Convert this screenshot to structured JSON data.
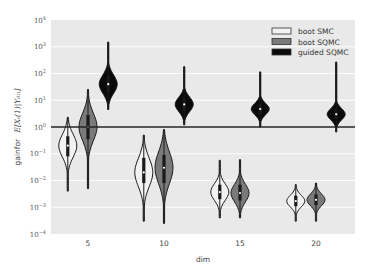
{
  "chart_data": {
    "type": "violin",
    "title": "",
    "xlabel": "dim",
    "ylabel": "gainfor  E[X_t(1)|Y_0:t]",
    "ylabel_prefix": "gainfor",
    "ylabel_math": "E[Xₜ(1)|Y₀:ₜ]",
    "yscale": "log",
    "ylim": [
      0.0001,
      10000
    ],
    "y_ticks": [
      {
        "exp": 4,
        "label": "10",
        "sup": "4"
      },
      {
        "exp": 3,
        "label": "10",
        "sup": "3"
      },
      {
        "exp": 2,
        "label": "10",
        "sup": "2"
      },
      {
        "exp": 1,
        "label": "10",
        "sup": "1"
      },
      {
        "exp": 0,
        "label": "10",
        "sup": "0"
      },
      {
        "exp": -1,
        "label": "10",
        "sup": "−1"
      },
      {
        "exp": -2,
        "label": "10",
        "sup": "−2"
      },
      {
        "exp": -3,
        "label": "10",
        "sup": "−3"
      },
      {
        "exp": -4,
        "label": "10",
        "sup": "−4"
      }
    ],
    "categories": [
      "5",
      "10",
      "15",
      "20"
    ],
    "x_values": [
      5,
      10,
      15,
      20
    ],
    "xlim": [
      2.5,
      22.5
    ],
    "reference_line": 1,
    "grid": true,
    "legend_position": "top-right",
    "series": [
      {
        "name": "boot SMC",
        "fill": "#f2f2f2",
        "offset": -1.33,
        "distributions": [
          {
            "x": 5,
            "min": 0.004,
            "max": 2.3,
            "median": 0.2,
            "q1": 0.08,
            "q3": 0.45
          },
          {
            "x": 10,
            "min": 0.0003,
            "max": 0.5,
            "median": 0.02,
            "q1": 0.008,
            "q3": 0.07
          },
          {
            "x": 15,
            "min": 0.0004,
            "max": 0.057,
            "median": 0.0037,
            "q1": 0.002,
            "q3": 0.007
          },
          {
            "x": 20,
            "min": 0.0003,
            "max": 0.007,
            "median": 0.0017,
            "q1": 0.0011,
            "q3": 0.0027
          }
        ]
      },
      {
        "name": "boot SQMC",
        "fill": "#7a7a7a",
        "offset": 0,
        "distributions": [
          {
            "x": 5,
            "min": 0.005,
            "max": 25,
            "median": 1.0,
            "q1": 0.35,
            "q3": 2.8
          },
          {
            "x": 10,
            "min": 0.00025,
            "max": 0.8,
            "median": 0.03,
            "q1": 0.008,
            "q3": 0.09
          },
          {
            "x": 15,
            "min": 0.0004,
            "max": 0.06,
            "median": 0.0034,
            "q1": 0.0018,
            "q3": 0.007
          },
          {
            "x": 20,
            "min": 0.0003,
            "max": 0.008,
            "median": 0.0019,
            "q1": 0.0012,
            "q3": 0.003
          }
        ]
      },
      {
        "name": "guided SQMC",
        "fill": "#0a0a0a",
        "offset": 1.33,
        "distributions": [
          {
            "x": 5,
            "min": 4.5,
            "max": 1500,
            "median": 40,
            "q1": 20,
            "q3": 80
          },
          {
            "x": 10,
            "min": 1.2,
            "max": 180,
            "median": 7,
            "q1": 4,
            "q3": 12
          },
          {
            "x": 15,
            "min": 1.0,
            "max": 115,
            "median": 4.7,
            "q1": 3,
            "q3": 7
          },
          {
            "x": 20,
            "min": 0.65,
            "max": 270,
            "median": 3.0,
            "q1": 2,
            "q3": 4.5
          }
        ]
      }
    ]
  }
}
